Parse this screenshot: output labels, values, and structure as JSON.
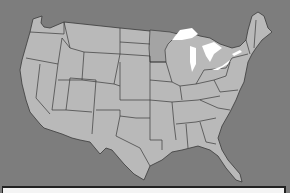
{
  "map": {
    "subject": "Contiguous United States",
    "colors": {
      "background": "#7d7d7d",
      "land": "#b9b9b9",
      "land_alt": "#a4a4a4",
      "borders": "#3a3a3a",
      "lakes": "#ffffff",
      "panel": "#f4f4f4"
    },
    "features": [
      "state-borders",
      "great-lakes",
      "coastlines"
    ]
  }
}
